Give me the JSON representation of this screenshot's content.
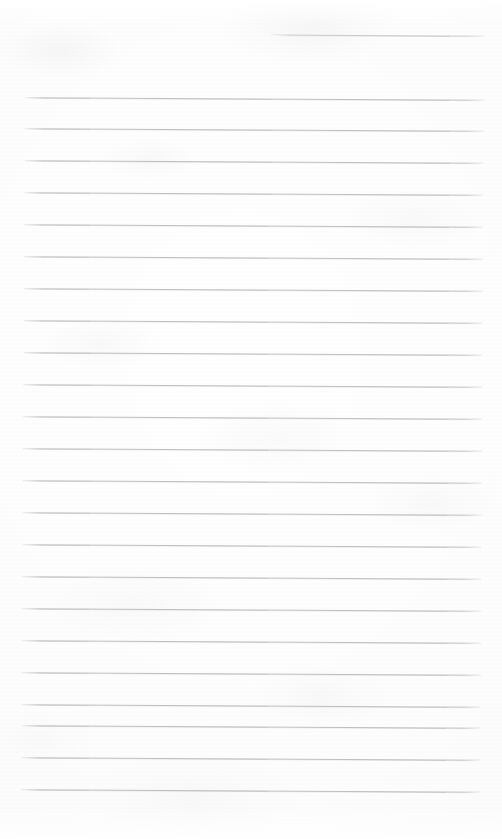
{
  "document": {
    "type": "scanned-lined-notepad-page",
    "title": "Blank lined notepad page",
    "has_text_content": false,
    "visible_text": "",
    "page_width": 502,
    "page_height": 839
  },
  "paper": {
    "background_color": "#fdfdfd",
    "edge_tint_color": "#f9f9fa",
    "mottle_color": "#e8e8ec"
  },
  "rules": {
    "color": "#969aa0",
    "thickness_px": 1,
    "spacing_px": 32,
    "left_x": 26,
    "right_x": 484,
    "skew_degrees": 0.32,
    "count_total": 23,
    "count_full": 22,
    "count_partial": 1,
    "lines": [
      {
        "index": 0,
        "y": 33,
        "x1": 272,
        "x2": 484,
        "partial": true
      },
      {
        "index": 1,
        "y": 97,
        "x1": 26,
        "x2": 484,
        "partial": false
      },
      {
        "index": 2,
        "y": 128,
        "x1": 26,
        "x2": 484,
        "partial": false
      },
      {
        "index": 3,
        "y": 160,
        "x1": 26,
        "x2": 484,
        "partial": false
      },
      {
        "index": 4,
        "y": 192,
        "x1": 26,
        "x2": 484,
        "partial": false
      },
      {
        "index": 5,
        "y": 224,
        "x1": 26,
        "x2": 484,
        "partial": false
      },
      {
        "index": 6,
        "y": 256,
        "x1": 26,
        "x2": 484,
        "partial": false
      },
      {
        "index": 7,
        "y": 288,
        "x1": 26,
        "x2": 484,
        "partial": false
      },
      {
        "index": 8,
        "y": 320,
        "x1": 26,
        "x2": 484,
        "partial": false
      },
      {
        "index": 9,
        "y": 352,
        "x1": 26,
        "x2": 484,
        "partial": false
      },
      {
        "index": 10,
        "y": 384,
        "x1": 26,
        "x2": 484,
        "partial": false
      },
      {
        "index": 11,
        "y": 416,
        "x1": 26,
        "x2": 484,
        "partial": false
      },
      {
        "index": 12,
        "y": 448,
        "x1": 26,
        "x2": 484,
        "partial": false
      },
      {
        "index": 13,
        "y": 480,
        "x1": 26,
        "x2": 484,
        "partial": false
      },
      {
        "index": 14,
        "y": 512,
        "x1": 26,
        "x2": 484,
        "partial": false
      },
      {
        "index": 15,
        "y": 544,
        "x1": 26,
        "x2": 484,
        "partial": false
      },
      {
        "index": 16,
        "y": 576,
        "x1": 26,
        "x2": 484,
        "partial": false
      },
      {
        "index": 17,
        "y": 608,
        "x1": 26,
        "x2": 484,
        "partial": false
      },
      {
        "index": 18,
        "y": 640,
        "x1": 26,
        "x2": 484,
        "partial": false
      },
      {
        "index": 19,
        "y": 672,
        "x1": 26,
        "x2": 484,
        "partial": false
      },
      {
        "index": 20,
        "y": 704,
        "x1": 26,
        "x2": 484,
        "partial": false
      },
      {
        "index": 21,
        "y": 725,
        "x1": 26,
        "x2": 484,
        "partial": false
      },
      {
        "index": 22,
        "y": 757,
        "x1": 26,
        "x2": 484,
        "partial": false
      },
      {
        "index": 23,
        "y": 789,
        "x1": 26,
        "x2": 484,
        "partial": false
      }
    ]
  }
}
